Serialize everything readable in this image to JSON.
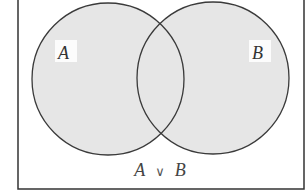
{
  "diagram": {
    "type": "venn",
    "sets": [
      {
        "id": "A",
        "label": "A",
        "cx": 108,
        "cy": 79,
        "r": 76
      },
      {
        "id": "B",
        "label": "B",
        "cx": 213,
        "cy": 78,
        "r": 76
      }
    ],
    "caption": {
      "left": "A",
      "operator": "∨",
      "right": "B"
    },
    "shaded_region": "A ∪ B",
    "colors": {
      "fill": "#e6e6e6",
      "stroke": "#3a3a3a",
      "frame": "#333333",
      "background": "#ffffff"
    }
  }
}
